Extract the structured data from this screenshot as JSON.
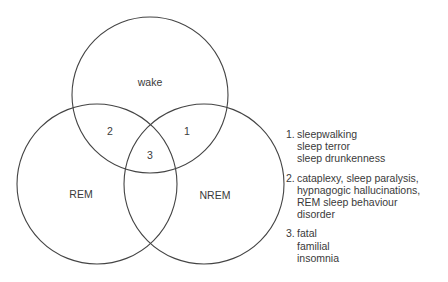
{
  "diagram": {
    "type": "venn",
    "circles": [
      {
        "id": "wake",
        "label": "wake",
        "cx": 150,
        "cy": 95,
        "r": 78
      },
      {
        "id": "rem",
        "label": "REM",
        "cx": 97,
        "cy": 184,
        "r": 80
      },
      {
        "id": "nrem",
        "label": "NREM",
        "cx": 204,
        "cy": 184,
        "r": 80
      }
    ],
    "stroke_color": "#444444",
    "region_labels": {
      "wake": "wake",
      "rem": "REM",
      "nrem": "NREM",
      "wake_nrem": "1",
      "wake_rem": "2",
      "all_three": "3"
    }
  },
  "legend": [
    {
      "number": "1.",
      "lines": [
        "sleepwalking",
        "sleep terror",
        "sleep drunkenness"
      ]
    },
    {
      "number": "2.",
      "lines": [
        "cataplexy, sleep paralysis,",
        "hypnagogic hallucinations,",
        "REM sleep behaviour",
        "disorder"
      ]
    },
    {
      "number": "3.",
      "lines": [
        "fatal",
        "familial",
        "insomnia"
      ]
    }
  ]
}
